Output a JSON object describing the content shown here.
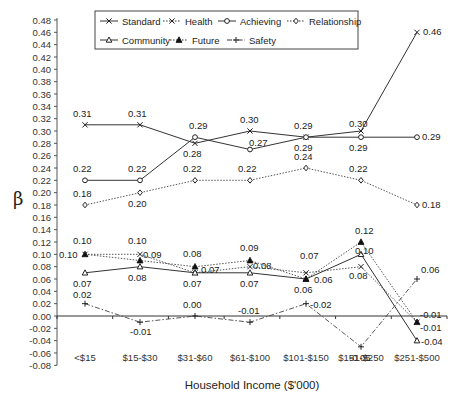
{
  "chart_data": {
    "type": "line",
    "title": "",
    "xlabel": "Household Income ($'000)",
    "ylabel": "β",
    "ylim": [
      -0.08,
      0.48
    ],
    "ytick_step": 0.02,
    "grid": false,
    "legend_position": "top-inside",
    "categories": [
      "<$15",
      "$15-$30",
      "$31-$60",
      "$61-$100",
      "$101-$150",
      "$151-$250",
      "$251-$500"
    ],
    "series": [
      {
        "name": "Standard",
        "marker": "x",
        "line": "solid",
        "values": [
          0.31,
          0.31,
          0.28,
          0.3,
          0.29,
          0.3,
          0.46
        ]
      },
      {
        "name": "Health",
        "marker": "x",
        "line": "dotted",
        "values": [
          0.1,
          0.1,
          0.07,
          0.08,
          0.07,
          0.08,
          -0.01
        ]
      },
      {
        "name": "Achieving",
        "marker": "circle",
        "line": "solid",
        "values": [
          0.22,
          0.22,
          0.29,
          0.27,
          0.29,
          0.29,
          0.29
        ]
      },
      {
        "name": "Relationship",
        "marker": "diamond",
        "line": "dotted",
        "values": [
          0.18,
          0.2,
          0.22,
          0.22,
          0.24,
          0.22,
          0.18
        ]
      },
      {
        "name": "Community",
        "marker": "triangle-open",
        "line": "solid",
        "values": [
          0.07,
          0.08,
          0.07,
          0.07,
          0.06,
          0.1,
          -0.04
        ]
      },
      {
        "name": "Future",
        "marker": "triangle-filled",
        "line": "dotted",
        "values": [
          0.1,
          0.09,
          0.08,
          0.09,
          0.06,
          0.12,
          -0.01
        ]
      },
      {
        "name": "Safety",
        "marker": "plus",
        "line": "dashdot",
        "values": [
          0.02,
          -0.01,
          0.0,
          -0.01,
          0.02,
          -0.05,
          0.06
        ]
      }
    ],
    "data_labels": [
      {
        "x": 0,
        "v": 0.31,
        "text": "0.31",
        "dx": -12,
        "dy": -8
      },
      {
        "x": 1,
        "v": 0.31,
        "text": "0.31",
        "dx": -12,
        "dy": -8
      },
      {
        "x": 2,
        "v": 0.28,
        "text": "0.28",
        "dx": -12,
        "dy": 14
      },
      {
        "x": 3,
        "v": 0.3,
        "text": "0.30",
        "dx": -10,
        "dy": -8
      },
      {
        "x": 4,
        "v": 0.29,
        "text": "0.29",
        "dx": -12,
        "dy": -8
      },
      {
        "x": 5,
        "v": 0.3,
        "text": "0.30",
        "dx": -12,
        "dy": -4
      },
      {
        "x": 6,
        "v": 0.46,
        "text": "0.46",
        "dx": 6,
        "dy": 3
      },
      {
        "x": 0,
        "v": 0.22,
        "text": "0.22",
        "dx": -12,
        "dy": -8
      },
      {
        "x": 1,
        "v": 0.22,
        "text": "0.22",
        "dx": -12,
        "dy": -8
      },
      {
        "x": 2,
        "v": 0.29,
        "text": "0.29",
        "dx": -6,
        "dy": -8
      },
      {
        "x": 3,
        "v": 0.27,
        "text": "0.27",
        "dx": -1,
        "dy": -4
      },
      {
        "x": 4,
        "v": 0.29,
        "text": "0.29",
        "dx": -12,
        "dy": 14
      },
      {
        "x": 5,
        "v": 0.29,
        "text": "0.29",
        "dx": -12,
        "dy": 14
      },
      {
        "x": 6,
        "v": 0.29,
        "text": "0.29",
        "dx": 5,
        "dy": 3
      },
      {
        "x": 0,
        "v": 0.18,
        "text": "0.18",
        "dx": -12,
        "dy": -8
      },
      {
        "x": 1,
        "v": 0.2,
        "text": "0.20",
        "dx": -12,
        "dy": 14
      },
      {
        "x": 2,
        "v": 0.22,
        "text": "0.22",
        "dx": -12,
        "dy": -8
      },
      {
        "x": 3,
        "v": 0.22,
        "text": "0.22",
        "dx": -12,
        "dy": -8
      },
      {
        "x": 4,
        "v": 0.24,
        "text": "0.24",
        "dx": -12,
        "dy": -8
      },
      {
        "x": 5,
        "v": 0.22,
        "text": "0.22",
        "dx": -12,
        "dy": -8
      },
      {
        "x": 6,
        "v": 0.18,
        "text": "0.18",
        "dx": 5,
        "dy": 3
      },
      {
        "x": 0,
        "v": 0.1,
        "text": "0.10",
        "dx": -12,
        "dy": -10
      },
      {
        "x": 0,
        "v": 0.1,
        "text": "0.10",
        "dx": -26,
        "dy": 4
      },
      {
        "x": 1,
        "v": 0.1,
        "text": "0.10",
        "dx": -12,
        "dy": -10
      },
      {
        "x": 1,
        "v": 0.1,
        "text": "0.09",
        "dx": 3,
        "dy": 4
      },
      {
        "x": 0,
        "v": 0.07,
        "text": "0.07",
        "dx": -12,
        "dy": 14
      },
      {
        "x": 1,
        "v": 0.08,
        "text": "0.08",
        "dx": -12,
        "dy": 14
      },
      {
        "x": 2,
        "v": 0.08,
        "text": "0.08",
        "dx": -12,
        "dy": -10
      },
      {
        "x": 2,
        "v": 0.07,
        "text": "0.07",
        "dx": 6,
        "dy": 0
      },
      {
        "x": 2,
        "v": 0.07,
        "text": "0.07",
        "dx": -12,
        "dy": 14
      },
      {
        "x": 3,
        "v": 0.09,
        "text": "0.09",
        "dx": -10,
        "dy": -10
      },
      {
        "x": 3,
        "v": 0.08,
        "text": "0.08",
        "dx": 3,
        "dy": 2
      },
      {
        "x": 3,
        "v": 0.07,
        "text": "0.07",
        "dx": -10,
        "dy": 14
      },
      {
        "x": 4,
        "v": 0.07,
        "text": "0.07",
        "dx": -6,
        "dy": -14
      },
      {
        "x": 4,
        "v": 0.06,
        "text": "0.06",
        "dx": 8,
        "dy": 4
      },
      {
        "x": 4,
        "v": 0.06,
        "text": "0.06",
        "dx": -12,
        "dy": 14
      },
      {
        "x": 5,
        "v": 0.12,
        "text": "0.12",
        "dx": -6,
        "dy": -8
      },
      {
        "x": 5,
        "v": 0.1,
        "text": "0.10",
        "dx": -6,
        "dy": 0
      },
      {
        "x": 5,
        "v": 0.08,
        "text": "0.08",
        "dx": -12,
        "dy": 12
      },
      {
        "x": 6,
        "v": -0.01,
        "text": "-0.01",
        "dx": 3,
        "dy": -4
      },
      {
        "x": 6,
        "v": -0.01,
        "text": "-0.01",
        "dx": 3,
        "dy": 9
      },
      {
        "x": 6,
        "v": -0.04,
        "text": "-0.04",
        "dx": 4,
        "dy": 4
      },
      {
        "x": 0,
        "v": 0.02,
        "text": "0.02",
        "dx": -12,
        "dy": -6
      },
      {
        "x": 1,
        "v": -0.01,
        "text": "-0.01",
        "dx": -10,
        "dy": 13
      },
      {
        "x": 2,
        "v": 0.0,
        "text": "0.00",
        "dx": -12,
        "dy": -8
      },
      {
        "x": 3,
        "v": -0.01,
        "text": "-0.01",
        "dx": -12,
        "dy": -8
      },
      {
        "x": 4,
        "v": 0.02,
        "text": "-0.02",
        "dx": 4,
        "dy": 4
      },
      {
        "x": 5,
        "v": -0.05,
        "text": "-0.05",
        "dx": -12,
        "dy": 14
      },
      {
        "x": 6,
        "v": 0.06,
        "text": "0.06",
        "dx": 4,
        "dy": -6
      }
    ]
  },
  "legend": {
    "rows": [
      [
        "Standard",
        "Health",
        "Achieving",
        "Relationship"
      ],
      [
        "Community",
        "Future",
        "Safety"
      ]
    ]
  },
  "axes": {
    "ylabel": "β",
    "xlabel": "Household Income ($'000)"
  }
}
